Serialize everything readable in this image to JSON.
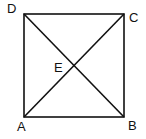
{
  "diagram": {
    "type": "square-with-diagonals",
    "stroke_color": "#111111",
    "background": "#ffffff",
    "vertices": [
      {
        "label": "A",
        "x": 24,
        "y": 117
      },
      {
        "label": "B",
        "x": 124,
        "y": 117
      },
      {
        "label": "C",
        "x": 124,
        "y": 14
      },
      {
        "label": "D",
        "x": 24,
        "y": 14
      }
    ],
    "intersection": {
      "label": "E",
      "x": 74,
      "y": 65
    },
    "edges": [
      "AB",
      "BC",
      "CD",
      "DA",
      "AC",
      "BD"
    ],
    "labels": {
      "A": "A",
      "B": "B",
      "C": "C",
      "D": "D",
      "E": "E"
    }
  }
}
